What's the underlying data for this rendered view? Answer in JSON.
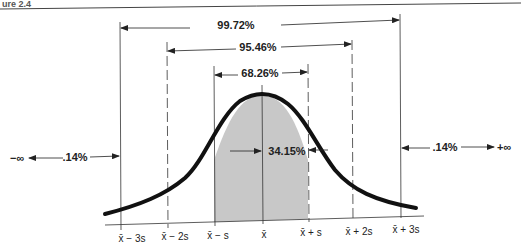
{
  "header": {
    "fragment": "ure 2.4"
  },
  "diagram": {
    "brackets": [
      {
        "label": "99.72%",
        "from": "x̄ − 3s",
        "to": "x̄ + 3s"
      },
      {
        "label": "95.46%",
        "from": "x̄ − 2s",
        "to": "x̄ + 2s"
      },
      {
        "label": "68.26%",
        "from": "x̄ − s",
        "to": "x̄ + s"
      }
    ],
    "inner_label": "34.15%",
    "left_tail": {
      "infinity": "−∞",
      "label": ".14%"
    },
    "right_tail": {
      "infinity": "+∞",
      "label": ".14%"
    },
    "axis_ticks": [
      "x̄ − 3s",
      "x̄ − 2s",
      "x̄ − s",
      "x̄",
      "x̄ + s",
      "x̄ + 2s",
      "x̄ + 3s"
    ],
    "colors": {
      "shade": "#c8c8c8",
      "line": "#111111",
      "curve": "#111111"
    }
  }
}
